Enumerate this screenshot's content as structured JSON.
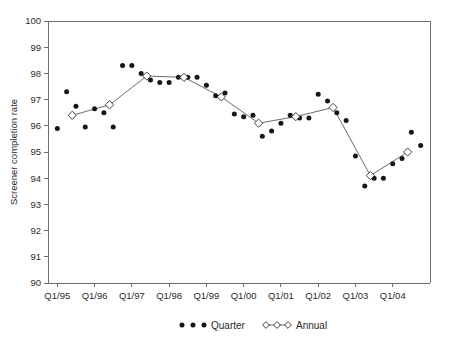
{
  "chart_data": {
    "type": "scatter",
    "title": "",
    "xlabel": "",
    "ylabel": "Screener completion rate",
    "ylim": [
      90,
      100
    ],
    "yticks": [
      90,
      91,
      92,
      93,
      94,
      95,
      96,
      97,
      98,
      99,
      100
    ],
    "xtick_labels": [
      "Q1/95",
      "Q1/96",
      "Q1/97",
      "Q1/98",
      "Q1/99",
      "Q1/00",
      "Q1/01",
      "Q1/02",
      "Q1/03",
      "Q1/04"
    ],
    "xtick_years": [
      1995,
      1996,
      1997,
      1998,
      1999,
      2000,
      2001,
      2002,
      2003,
      2004
    ],
    "grid": false,
    "legend_position": "bottom",
    "series": [
      {
        "name": "Quarter",
        "marker": "filled-circle",
        "line": false,
        "points": [
          {
            "x": 1995.0,
            "label": "Q1/95",
            "y": 95.9
          },
          {
            "x": 1995.25,
            "label": "Q2/95",
            "y": 97.3
          },
          {
            "x": 1995.5,
            "label": "Q3/95",
            "y": 96.75
          },
          {
            "x": 1995.75,
            "label": "Q4/95",
            "y": 95.95
          },
          {
            "x": 1996.0,
            "label": "Q1/96",
            "y": 96.65
          },
          {
            "x": 1996.25,
            "label": "Q2/96",
            "y": 96.5
          },
          {
            "x": 1996.5,
            "label": "Q3/96",
            "y": 95.95
          },
          {
            "x": 1996.75,
            "label": "Q4/96",
            "y": 98.3
          },
          {
            "x": 1997.0,
            "label": "Q1/97",
            "y": 98.3
          },
          {
            "x": 1997.25,
            "label": "Q2/97",
            "y": 98.0
          },
          {
            "x": 1997.5,
            "label": "Q3/97",
            "y": 97.75
          },
          {
            "x": 1997.75,
            "label": "Q4/97",
            "y": 97.65
          },
          {
            "x": 1998.0,
            "label": "Q1/98",
            "y": 97.65
          },
          {
            "x": 1998.25,
            "label": "Q2/98",
            "y": 97.85
          },
          {
            "x": 1998.5,
            "label": "Q3/98",
            "y": 97.85
          },
          {
            "x": 1998.75,
            "label": "Q4/98",
            "y": 97.85
          },
          {
            "x": 1999.0,
            "label": "Q1/99",
            "y": 97.55
          },
          {
            "x": 1999.25,
            "label": "Q2/99",
            "y": 97.15
          },
          {
            "x": 1999.5,
            "label": "Q3/99",
            "y": 97.25
          },
          {
            "x": 1999.75,
            "label": "Q4/99",
            "y": 96.45
          },
          {
            "x": 2000.0,
            "label": "Q1/00",
            "y": 96.35
          },
          {
            "x": 2000.25,
            "label": "Q2/00",
            "y": 96.4
          },
          {
            "x": 2000.5,
            "label": "Q3/00",
            "y": 95.6
          },
          {
            "x": 2000.75,
            "label": "Q4/00",
            "y": 95.8
          },
          {
            "x": 2001.0,
            "label": "Q1/01",
            "y": 96.1
          },
          {
            "x": 2001.25,
            "label": "Q2/01",
            "y": 96.4
          },
          {
            "x": 2001.5,
            "label": "Q3/01",
            "y": 96.3
          },
          {
            "x": 2001.75,
            "label": "Q4/01",
            "y": 96.3
          },
          {
            "x": 2002.0,
            "label": "Q1/02",
            "y": 97.2
          },
          {
            "x": 2002.25,
            "label": "Q2/02",
            "y": 96.95
          },
          {
            "x": 2002.5,
            "label": "Q3/02",
            "y": 96.5
          },
          {
            "x": 2002.75,
            "label": "Q4/02",
            "y": 96.2
          },
          {
            "x": 2003.0,
            "label": "Q1/03",
            "y": 94.85
          },
          {
            "x": 2003.25,
            "label": "Q2/03",
            "y": 93.7
          },
          {
            "x": 2003.5,
            "label": "Q3/03",
            "y": 94.0
          },
          {
            "x": 2003.75,
            "label": "Q4/03",
            "y": 94.0
          },
          {
            "x": 2004.0,
            "label": "Q1/04",
            "y": 94.55
          },
          {
            "x": 2004.25,
            "label": "Q2/04",
            "y": 94.75
          },
          {
            "x": 2004.5,
            "label": "Q3/04",
            "y": 95.75
          },
          {
            "x": 2004.75,
            "label": "Q4/04",
            "y": 95.25
          }
        ]
      },
      {
        "name": "Annual",
        "marker": "open-diamond",
        "line": true,
        "points": [
          {
            "x": 1995.4,
            "label": "1995",
            "y": 96.4
          },
          {
            "x": 1996.4,
            "label": "1996",
            "y": 96.8
          },
          {
            "x": 1997.4,
            "label": "1997",
            "y": 97.9
          },
          {
            "x": 1998.4,
            "label": "1998",
            "y": 97.85
          },
          {
            "x": 1999.4,
            "label": "1999",
            "y": 97.1
          },
          {
            "x": 2000.4,
            "label": "2000",
            "y": 96.1
          },
          {
            "x": 2001.4,
            "label": "2001",
            "y": 96.35
          },
          {
            "x": 2002.4,
            "label": "2002",
            "y": 96.7
          },
          {
            "x": 2003.4,
            "label": "2003",
            "y": 94.1
          },
          {
            "x": 2004.4,
            "label": "2004",
            "y": 95.0
          }
        ]
      }
    ]
  },
  "legend": {
    "items": [
      {
        "label": "Quarter",
        "marker": "filled-circle"
      },
      {
        "label": "Annual",
        "marker": "open-diamond-line"
      }
    ]
  },
  "colors": {
    "dot": "#161616",
    "line": "#5a5a5a",
    "axis": "#6e6e6e",
    "text": "#2b2b2b",
    "background": "#ffffff"
  }
}
